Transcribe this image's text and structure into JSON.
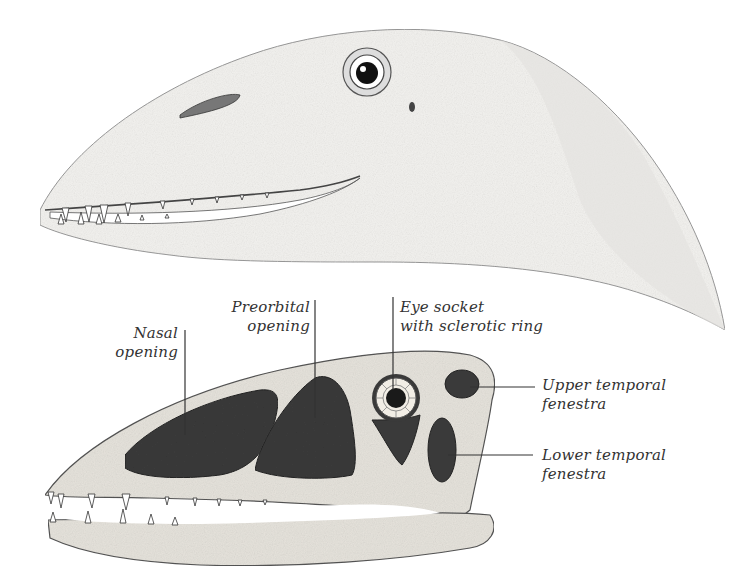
{
  "figure": {
    "head_illustration": "Dinosaur head in life appearance (side view)",
    "skull_illustration": "Dinosaur skull (side view) with labeled openings"
  },
  "labels": {
    "nasal_opening": {
      "line1": "Nasal",
      "line2": "opening"
    },
    "preorbital_opening": {
      "line1": "Preorbital",
      "line2": "opening"
    },
    "eye_socket": {
      "line1": "Eye socket",
      "line2": "with sclerotic ring"
    },
    "upper_temporal": {
      "line1": "Upper temporal",
      "line2": "fenestra"
    },
    "lower_temporal": {
      "line1": "Lower temporal",
      "line2": "fenestra"
    }
  },
  "colors": {
    "background": "#ffffff",
    "bone": "#e6e3dc",
    "opening": "#3a3a3a",
    "line": "#333333"
  }
}
